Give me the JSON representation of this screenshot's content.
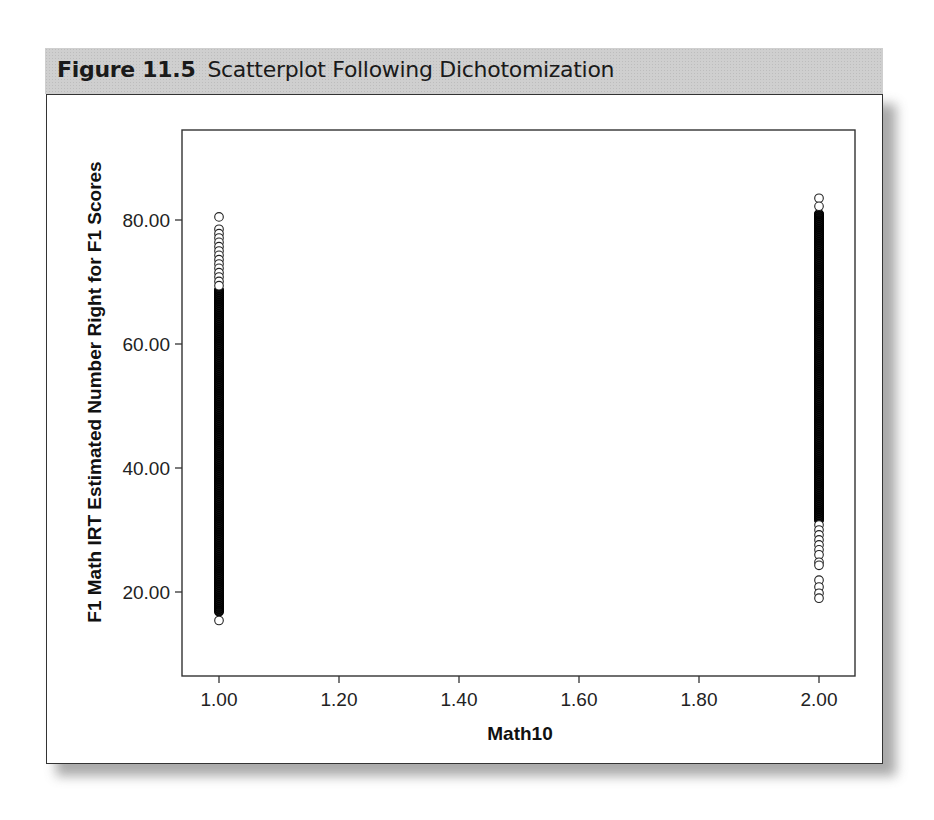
{
  "figure": {
    "number": "Figure 11.5",
    "caption": "Scatterplot Following Dichotomization"
  },
  "chart_data": {
    "type": "scatter",
    "title": "Scatterplot Following Dichotomization",
    "xlabel": "Math10",
    "ylabel": "F1 Math IRT Estimated Number Right for F1 Scores",
    "xlim": [
      0.95,
      2.06
    ],
    "ylim": [
      6.0,
      94.0
    ],
    "x_ticks": [
      1.0,
      1.2,
      1.4,
      1.6,
      1.8,
      2.0
    ],
    "x_tick_labels": [
      "1.00",
      "1.20",
      "1.40",
      "1.60",
      "1.80",
      "2.00"
    ],
    "y_ticks": [
      20.0,
      40.0,
      60.0,
      80.0
    ],
    "y_tick_labels": [
      "20.00",
      "40.00",
      "60.00",
      "80.00"
    ],
    "grid": false,
    "legend": null,
    "marker": "open-circle",
    "series": [
      {
        "name": "Math10 = 1.00",
        "x": 1.0,
        "dense_range": [
          16.8,
          68.7
        ],
        "sparse_points": [
          80.5,
          78.5,
          77.8,
          77.1,
          76.4,
          75.7,
          75.0,
          74.3,
          73.6,
          72.9,
          72.2,
          71.5,
          70.8,
          70.1,
          69.4,
          15.4
        ]
      },
      {
        "name": "Math10 = 2.00",
        "x": 2.0,
        "dense_range": [
          31.6,
          81.0
        ],
        "sparse_points": [
          83.5,
          82.2,
          30.8,
          30.0,
          29.2,
          28.4,
          27.6,
          26.8,
          26.0,
          24.8,
          24.3,
          21.9,
          20.8,
          19.8,
          19.0
        ]
      }
    ]
  }
}
